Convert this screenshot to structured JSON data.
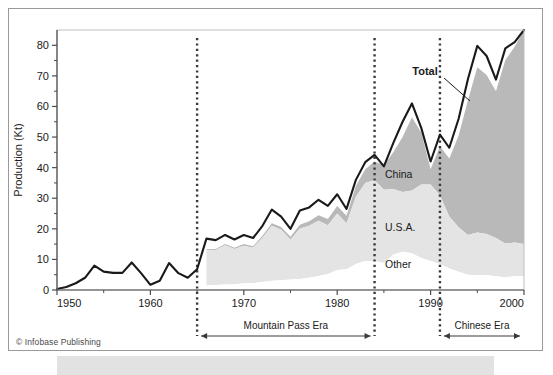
{
  "figure": {
    "credit": "© Infobase Publishing",
    "colors": {
      "total_line": "#1a1a1a",
      "china_fill": "#b9b9b9",
      "usa_fill": "#e4e4e4",
      "other_fill": "#ffffff",
      "axis": "#4c4c4c",
      "frame": "#9a9a9a",
      "bottom_band": "#e2e2e2"
    }
  },
  "chart_data": {
    "type": "area",
    "title": "",
    "xlabel": "",
    "ylabel": "Production (Kt)",
    "xlim": [
      1950,
      2000
    ],
    "ylim": [
      0,
      85
    ],
    "grid": false,
    "legend_position": "inline-annotation",
    "x_ticks_major": [
      1950,
      1960,
      1970,
      1980,
      1990,
      2000
    ],
    "x_ticks_minor": [
      1955,
      1965,
      1975,
      1985,
      1995
    ],
    "y_ticks_major": [
      0,
      10,
      20,
      30,
      40,
      50,
      60,
      70,
      80
    ],
    "y_ticks_minor": [
      5,
      15,
      25,
      35,
      45,
      55,
      65,
      75
    ],
    "x": [
      1950,
      1951,
      1952,
      1953,
      1954,
      1955,
      1956,
      1957,
      1958,
      1959,
      1960,
      1961,
      1962,
      1963,
      1964,
      1965,
      1966,
      1967,
      1968,
      1969,
      1970,
      1971,
      1972,
      1973,
      1974,
      1975,
      1976,
      1977,
      1978,
      1979,
      1980,
      1981,
      1982,
      1983,
      1984,
      1985,
      1986,
      1987,
      1988,
      1989,
      1990,
      1991,
      1992,
      1993,
      1994,
      1995,
      1996,
      1997,
      1998,
      1999,
      2000
    ],
    "series": [
      {
        "name": "Total",
        "label": "Total",
        "stacked": false,
        "values": [
          0.3,
          1.0,
          2.2,
          4.0,
          8.0,
          6.0,
          5.6,
          5.6,
          9.0,
          5.5,
          1.7,
          3.0,
          8.8,
          5.5,
          4.0,
          6.8,
          16.8,
          16.3,
          18.0,
          16.5,
          18.0,
          17.0,
          21.0,
          26.3,
          24.0,
          20.0,
          26.0,
          27.0,
          29.5,
          27.5,
          31.3,
          26.5,
          36.0,
          41.8,
          44.2,
          40.4,
          48.0,
          55.0,
          61.0,
          53.0,
          42.0,
          50.8,
          46.5,
          56.0,
          69.0,
          79.8,
          76.5,
          68.8,
          79.0,
          81.0,
          85.0
        ]
      },
      {
        "name": "China",
        "label": "China",
        "stacked": true,
        "values": [
          0,
          0,
          0,
          0,
          0,
          0,
          0,
          0,
          0,
          0,
          0,
          0,
          0,
          0,
          0,
          0,
          0.3,
          0.3,
          0.4,
          0.4,
          0.5,
          0.5,
          0.6,
          0.8,
          0.9,
          1.0,
          1.2,
          1.5,
          1.8,
          2.0,
          2.5,
          2.5,
          3.5,
          4.5,
          6.0,
          8.0,
          12.0,
          18.0,
          24.0,
          17.0,
          5.0,
          16.0,
          19.0,
          30.0,
          44.0,
          54.0,
          52.0,
          48.0,
          60.0,
          64.0,
          70.0
        ]
      },
      {
        "name": "U.S.A.",
        "label": "U.S.A.",
        "stacked": true,
        "values": [
          0,
          0,
          0,
          0,
          0,
          0,
          0,
          0,
          0,
          0,
          0,
          0,
          0,
          0,
          0,
          0,
          11.5,
          11.5,
          12.8,
          11.5,
          12.3,
          11.5,
          14.5,
          18.0,
          16.5,
          13.0,
          16.5,
          17.0,
          18.0,
          16.0,
          18.5,
          15.0,
          22.0,
          25.5,
          26.5,
          24.0,
          21.5,
          19.5,
          20.5,
          24.0,
          25.0,
          22.5,
          17.0,
          14.5,
          13.0,
          14.0,
          13.5,
          12.5,
          11.0,
          11.0,
          10.5
        ]
      },
      {
        "name": "Other",
        "label": "Other",
        "stacked": true,
        "values": [
          0,
          0,
          0,
          0,
          0,
          0,
          0,
          0,
          0,
          0,
          0,
          0,
          0,
          0,
          0,
          0,
          1.5,
          1.6,
          1.8,
          1.9,
          2.2,
          2.3,
          2.6,
          3.0,
          3.2,
          3.4,
          3.6,
          4.0,
          4.6,
          5.2,
          6.5,
          6.8,
          8.5,
          9.5,
          9.5,
          8.8,
          11.5,
          12.5,
          12.0,
          10.5,
          9.5,
          8.5,
          7.0,
          6.0,
          5.0,
          4.8,
          4.8,
          4.5,
          4.2,
          4.5,
          4.5
        ]
      }
    ],
    "annotations": [
      {
        "name": "total",
        "text": "Total",
        "bold": true
      },
      {
        "name": "china",
        "text": "China",
        "bold": false
      },
      {
        "name": "usa",
        "text": "U.S.A.",
        "bold": false
      },
      {
        "name": "other",
        "text": "Other",
        "bold": false
      }
    ],
    "eras": [
      {
        "name": "mountain-pass",
        "label": "Mountain Pass Era",
        "start": 1965,
        "end": 1984
      },
      {
        "name": "chinese",
        "label": "Chinese Era",
        "start": 1991,
        "end": 2000
      }
    ],
    "era_markers_years": [
      1965,
      1984,
      1991
    ]
  },
  "axis_labels": {
    "y_title": "Production (Kt)",
    "y_values": [
      "0",
      "10",
      "20",
      "30",
      "40",
      "50",
      "60",
      "70",
      "80"
    ],
    "x_values": [
      "1950",
      "1960",
      "1970",
      "1980",
      "1990",
      "2000"
    ]
  }
}
